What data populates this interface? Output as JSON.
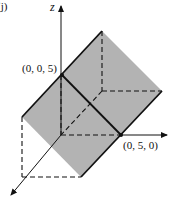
{
  "figure": {
    "panel_label": "(j)",
    "axes": {
      "z_label": "z",
      "y_label": "y",
      "x_label": "x"
    },
    "points": [
      {
        "label": "(0, 0, 5)",
        "coords": [
          0,
          0,
          5
        ]
      },
      {
        "label": "(0, 5, 0)",
        "coords": [
          0,
          5,
          0
        ]
      }
    ],
    "plane_color": "#b3b3b3",
    "line_color": "#111111"
  }
}
